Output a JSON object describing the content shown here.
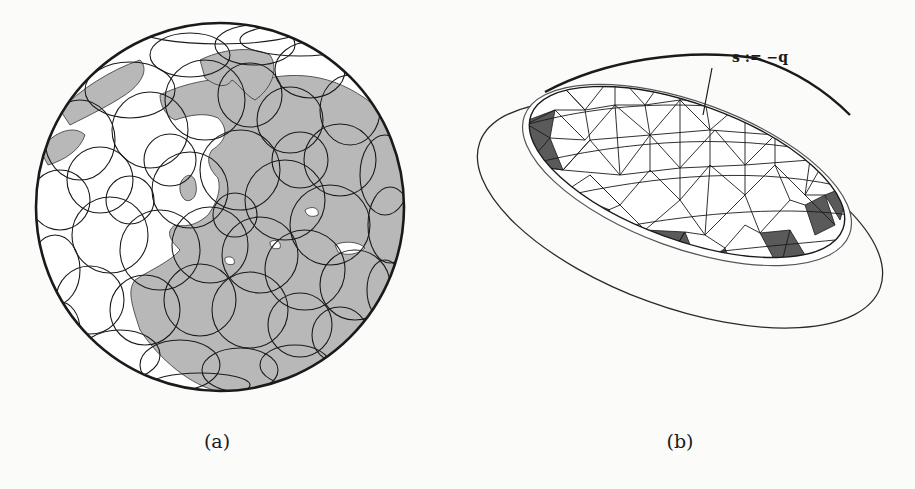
{
  "figure": {
    "panels": [
      {
        "id": "a",
        "caption": "(a)",
        "description": "Orthographic globe view centered on Europe/Mediterranean with many overlapping circular caps outlined in black; land shaded grey",
        "colors": {
          "land": "#b8b8b8",
          "ocean": "#ffffff",
          "circle_stroke": "#1a1a1a"
        }
      },
      {
        "id": "b",
        "caption": "(b)",
        "description": "Triangulated spherical cap (dome) viewed obliquely, inside two elliptical rings; boundary triangles shaded dark grey",
        "annotation": "s := −q",
        "colors": {
          "shaded_triangles": "#5a5a5a",
          "mesh_stroke": "#1a1a1a",
          "face": "#ffffff"
        }
      }
    ]
  }
}
